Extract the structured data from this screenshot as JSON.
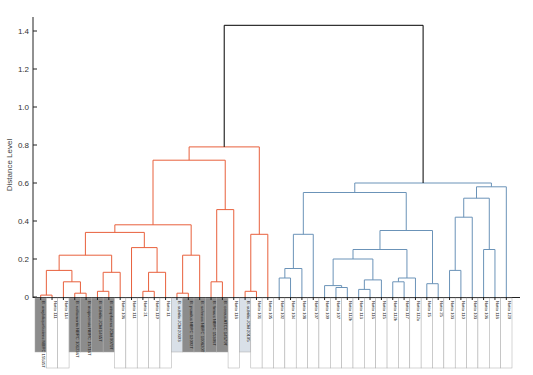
{
  "chart_data": {
    "type": "dendrogram",
    "title": "",
    "xlabel": "",
    "ylabel": "Distance Level",
    "ylim": [
      0,
      1.45
    ],
    "yticks": [
      0,
      0.2,
      0.4,
      0.6,
      0.8,
      1.0,
      1.2,
      1.4
    ],
    "ytick_labels": [
      "0",
      "0.2",
      "0.4",
      "0.6",
      "0.8",
      "1.0",
      "1.2",
      "1.4"
    ],
    "grid": false,
    "colors": {
      "left_cluster": "#e8603c",
      "right_cluster": "#6b93b8",
      "root": "#000000",
      "shade_dark": "#8c8c8c",
      "shade_light": "#d9e0e8"
    },
    "leaves": [
      {
        "label": "B. amyloliquefaciens NBRC 15535T",
        "shade": "dark"
      },
      {
        "label": "Natto 111",
        "shade": "none"
      },
      {
        "label": "Natto 114",
        "shade": "none"
      },
      {
        "label": "B. vallismortis NBRC 101236T",
        "shade": "dark"
      },
      {
        "label": "B. mojavensis NBRC 15718T",
        "shade": "dark"
      },
      {
        "label": "B. subtilis JCM 1465T",
        "shade": "dark"
      },
      {
        "label": "B. atrophaeus JCM 9070T",
        "shade": "dark"
      },
      {
        "label": "Natto 106",
        "shade": "none"
      },
      {
        "label": "Natto 111",
        "shade": "none"
      },
      {
        "label": "Natto 21",
        "shade": "none"
      },
      {
        "label": "Natto 119",
        "shade": "none"
      },
      {
        "label": "Natto 11",
        "shade": "none"
      },
      {
        "label": "B. subtilis JCM 20393",
        "shade": "light"
      },
      {
        "label": "B. pumilus NBRC 12092T",
        "shade": "dark"
      },
      {
        "label": "B. safensis NBRC 100820T",
        "shade": "dark"
      },
      {
        "label": "B. firmus NBRC 15306T",
        "shade": "dark"
      },
      {
        "label": "B. cereus ATCC 14579T",
        "shade": "dark"
      },
      {
        "label": "Natto 118",
        "shade": "none"
      },
      {
        "label": "B. subtilis JCM 20105",
        "shade": "light"
      },
      {
        "label": "Natto 101",
        "shade": "none"
      },
      {
        "label": "Natto 105",
        "shade": "none"
      },
      {
        "label": "Natto 102",
        "shade": "none"
      },
      {
        "label": "Natto 104",
        "shade": "none"
      },
      {
        "label": "Natto 108",
        "shade": "none"
      },
      {
        "label": "Natto 107",
        "shade": "none"
      },
      {
        "label": "Natto 109",
        "shade": "none"
      },
      {
        "label": "Natto 107",
        "shade": "none"
      },
      {
        "label": "Natto 112b",
        "shade": "none"
      },
      {
        "label": "Natto 113",
        "shade": "none"
      },
      {
        "label": "Natto 116",
        "shade": "none"
      },
      {
        "label": "Natto 115",
        "shade": "none"
      },
      {
        "label": "Natto 112b",
        "shade": "none"
      },
      {
        "label": "Natto 117",
        "shade": "none"
      },
      {
        "label": "Natto 112a",
        "shade": "none"
      },
      {
        "label": "Natto 15",
        "shade": "none"
      },
      {
        "label": "Natto 25",
        "shade": "none"
      },
      {
        "label": "Natto 103",
        "shade": "none"
      },
      {
        "label": "Natto 110",
        "shade": "none"
      },
      {
        "label": "Natto 103",
        "shade": "none"
      },
      {
        "label": "Natto 106",
        "shade": "none"
      },
      {
        "label": "Natto 118",
        "shade": "none"
      },
      {
        "label": "Natto 120",
        "shade": "none"
      }
    ],
    "merges": [
      {
        "name": "root",
        "height": 1.43,
        "children": [
          "left_cluster",
          "right_cluster"
        ]
      },
      {
        "name": "left_cluster",
        "height": 0.79
      },
      {
        "name": "right_cluster",
        "height": 0.6
      },
      {
        "name": "left_sub_a",
        "height": 0.72
      },
      {
        "name": "right_sub_a",
        "height": 0.55
      },
      {
        "name": "right_sub_b",
        "height": 0.58
      }
    ]
  }
}
